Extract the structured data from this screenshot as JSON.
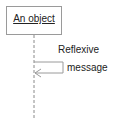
{
  "diagram": {
    "type": "UML sequence diagram",
    "object": {
      "label": "An object"
    },
    "message": {
      "kind": "reflexive",
      "label_line1": "Reflexive",
      "label_line2": "message"
    },
    "colors": {
      "line": "#9a9a9a",
      "text": "#222222"
    }
  }
}
